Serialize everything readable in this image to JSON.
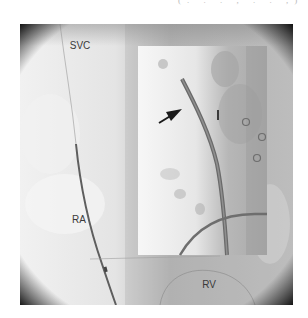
{
  "caption_fragment": "(. . . , . . ,)",
  "figure": {
    "type": "fluoroscopy image with inset",
    "labels": {
      "svc": "SVC",
      "ra": "RA",
      "rv": "RV"
    },
    "inset": {
      "arrow": "arrow-pointing-to-catheter",
      "markers": [
        "circle",
        "circle",
        "circle"
      ]
    },
    "colors": {
      "background_light": "#e8e8e8",
      "background_dark": "#9a9a9a",
      "vignette": "#111111",
      "lead": "#555555",
      "arrow": "#1a1a1a"
    }
  }
}
